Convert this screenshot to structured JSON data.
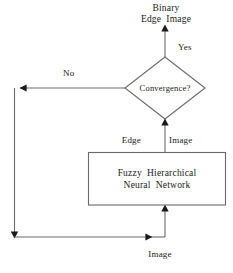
{
  "diagram": {
    "type": "flowchart",
    "line_color": "#4d4d4d",
    "text_color": "#1a1a1a",
    "background": "#ffffff",
    "labels": {
      "top_output": "Binary\nEdge  Image",
      "yes_branch": "Yes",
      "no_branch": "No",
      "decision": "Convergence?",
      "edge_word": "Edge",
      "image_word": "Image",
      "process": "Fuzzy  Hierarchical\nNeural  Network",
      "bottom_input": "Image"
    },
    "nodes": [
      {
        "id": "decision",
        "shape": "diamond",
        "text": "Convergence?",
        "cx": 165,
        "cy": 88,
        "rx": 40,
        "ry": 31
      },
      {
        "id": "process",
        "shape": "rectangle",
        "text": "Fuzzy  Hierarchical\nNeural  Network",
        "x": 88,
        "y": 152,
        "w": 138,
        "h": 53
      }
    ],
    "edges": [
      {
        "from": "decision",
        "to": "binary-edge-image-output",
        "label": "Yes",
        "direction": "up"
      },
      {
        "from": "decision",
        "to": "feedback-loop",
        "label": "No",
        "direction": "left"
      },
      {
        "from": "process",
        "to": "decision",
        "label": "Edge  Image",
        "direction": "up"
      },
      {
        "from": "feedback-loop",
        "to": "process",
        "label": "Image",
        "direction": "up"
      }
    ]
  }
}
